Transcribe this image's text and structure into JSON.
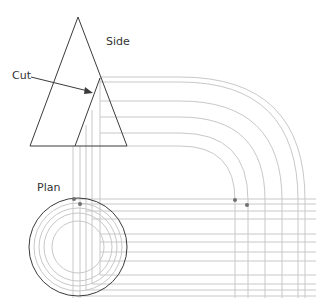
{
  "labels": {
    "side": "Side",
    "cut": "Cut",
    "plan": "Plan"
  },
  "colors": {
    "outline": "#3a3a3a",
    "construction": "#c8c8c8",
    "dot": "#707070",
    "background": "#ffffff"
  },
  "side_view": {
    "cone_apex": [
      78,
      17
    ],
    "cone_base": [
      [
        30,
        146
      ],
      [
        127,
        146
      ]
    ],
    "cut_apex": [
      100,
      78
    ],
    "cut_base_left": [
      75,
      146
    ]
  },
  "plan_view": {
    "center": [
      78,
      247
    ],
    "radii": [
      49,
      44,
      39,
      34,
      26
    ]
  }
}
